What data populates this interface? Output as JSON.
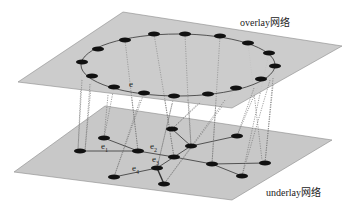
{
  "diagram": {
    "layers": [
      {
        "name": "overlay",
        "label": "overlay网络"
      },
      {
        "name": "underlay",
        "label": "underlay网络"
      }
    ],
    "edge_labels": {
      "overlay_edge": "e",
      "e1": {
        "base": "e",
        "sub": "1"
      },
      "e2": {
        "base": "e",
        "sub": "2"
      },
      "e3": {
        "base": "e",
        "sub": "3"
      },
      "e4": {
        "base": "e",
        "sub": "4"
      }
    },
    "colors": {
      "plane": "#c8c8c8",
      "plane_border": "#8a8a8a",
      "node": "#111111",
      "edge": "#333333",
      "mapping": "#777777"
    },
    "overlay_nodes": [
      [
        154,
        34
      ],
      [
        185,
        34
      ],
      [
        220,
        36
      ],
      [
        248,
        43
      ],
      [
        269,
        53
      ],
      [
        275,
        66
      ],
      [
        261,
        79
      ],
      [
        236,
        88
      ],
      [
        208,
        94
      ],
      [
        174,
        96
      ],
      [
        144,
        93
      ],
      [
        114,
        87
      ],
      [
        92,
        76
      ],
      [
        82,
        62
      ],
      [
        98,
        49
      ],
      [
        125,
        40
      ]
    ],
    "underlay_nodes": [
      [
        104,
        138
      ],
      [
        85,
        151
      ],
      [
        138,
        151
      ],
      [
        172,
        129
      ],
      [
        191,
        146
      ],
      [
        174,
        157
      ],
      [
        157,
        168
      ],
      [
        114,
        177
      ],
      [
        164,
        184
      ],
      [
        212,
        164
      ],
      [
        237,
        136
      ],
      [
        265,
        163
      ],
      [
        242,
        176
      ]
    ]
  }
}
